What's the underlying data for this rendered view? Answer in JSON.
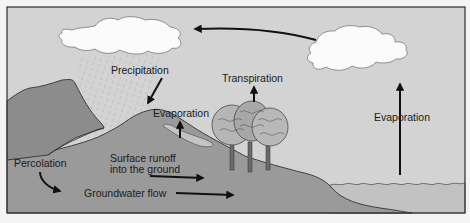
{
  "diagram": {
    "type": "water-cycle",
    "labels": {
      "precipitation": "Precipitation",
      "transpiration": "Transpiration",
      "evaporation_land": "Evaporation",
      "evaporation_water": "Evaporation",
      "percolation": "Percolation",
      "surface_runoff_line1": "Surface runoff",
      "surface_runoff_line2": "into the ground",
      "groundwater_flow": "Groundwater flow"
    },
    "colors": {
      "sky": "#d3d3d3",
      "mountain": "#8c8c8c",
      "ground": "#9a9a9a",
      "water": "#c2c2c2",
      "cloud": "#fbfbfb",
      "frame": "#3a3a3a",
      "arrow": "#111111"
    }
  }
}
